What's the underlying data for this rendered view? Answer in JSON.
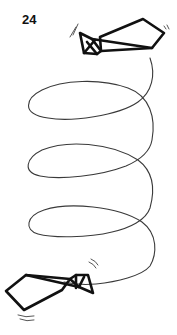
{
  "figure": {
    "number_label": "24",
    "colors": {
      "ink": "#111111",
      "path": "#3a3a3a",
      "background": "#ffffff"
    }
  }
}
